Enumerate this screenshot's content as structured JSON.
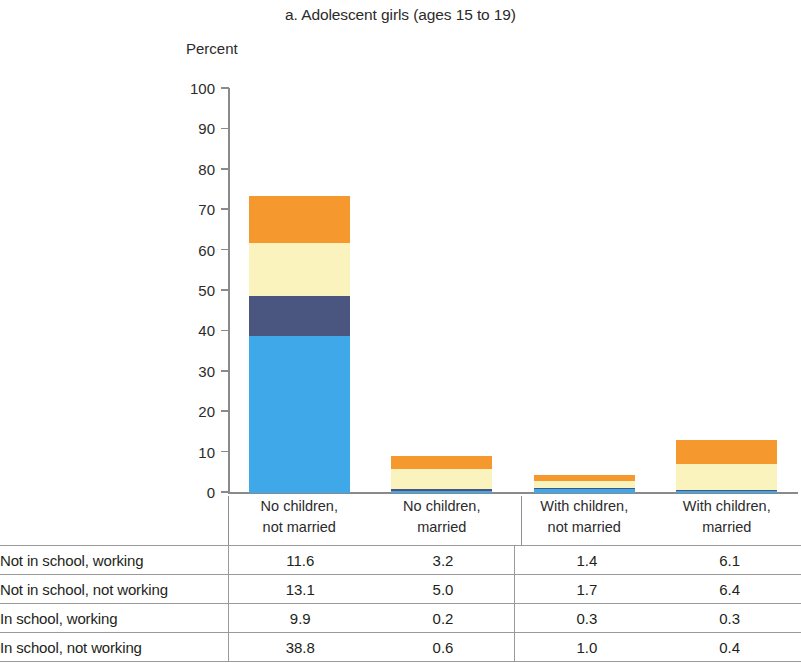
{
  "chart_data": {
    "type": "bar",
    "subtype": "stacked-bar",
    "title": "a. Adolescent girls (ages 15 to 19)",
    "xlabel": "",
    "ylabel": "Percent",
    "ylim": [
      0,
      100
    ],
    "yticks": [
      0,
      10,
      20,
      30,
      40,
      50,
      60,
      70,
      80,
      90,
      100
    ],
    "grid": false,
    "legend": "none",
    "categories": [
      "No children, not married",
      "No children, married",
      "With children, not married",
      "With children, married"
    ],
    "category_lines": [
      [
        "No children,",
        "not married"
      ],
      [
        "No children,",
        "married"
      ],
      [
        "With children,",
        "not married"
      ],
      [
        "With children,",
        "married"
      ]
    ],
    "series": [
      {
        "name": "In school, not working",
        "color": "#3EA8E8",
        "values": [
          38.8,
          0.6,
          1.0,
          0.4
        ]
      },
      {
        "name": "In school, working",
        "color": "#4A5580",
        "values": [
          9.9,
          0.2,
          0.3,
          0.3
        ]
      },
      {
        "name": "Not in school, not working",
        "color": "#FAF3BE",
        "values": [
          13.1,
          5.0,
          1.7,
          6.4
        ]
      },
      {
        "name": "Not in school, working",
        "color": "#F5992E",
        "values": [
          11.6,
          3.2,
          1.4,
          6.1
        ]
      }
    ],
    "totals": [
      73.4,
      9.0,
      4.4,
      13.2
    ]
  },
  "axis": {
    "percent_label": "Percent",
    "ticks": [
      "100",
      "90",
      "80",
      "70",
      "60",
      "50",
      "40",
      "30",
      "20",
      "10",
      "0"
    ]
  },
  "table": {
    "rows": [
      {
        "label": "Not in school, working",
        "values": [
          "11.6",
          "3.2",
          "1.4",
          "6.1"
        ]
      },
      {
        "label": "Not in school, not working",
        "values": [
          "13.1",
          "5.0",
          "1.7",
          "6.4"
        ]
      },
      {
        "label": "In school, working",
        "values": [
          "9.9",
          "0.2",
          "0.3",
          "0.3"
        ]
      },
      {
        "label": "In school, not working",
        "values": [
          "38.8",
          "0.6",
          "1.0",
          "0.4"
        ]
      }
    ]
  }
}
